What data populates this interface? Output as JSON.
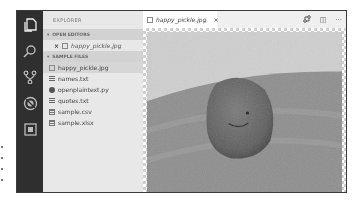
{
  "window": {
    "activity_bar": {
      "items": [
        {
          "id": "explorer",
          "icon": "files-icon"
        },
        {
          "id": "search",
          "icon": "search-icon"
        },
        {
          "id": "source-control",
          "icon": "source-control-icon"
        },
        {
          "id": "debug",
          "icon": "debug-icon"
        },
        {
          "id": "extensions",
          "icon": "extensions-icon"
        }
      ]
    },
    "sidebar": {
      "title": "EXPLORER",
      "open_editors": {
        "label": "OPEN EDITORS",
        "items": [
          {
            "name": "happy_pickle.jpg",
            "icon": "image-file-icon",
            "close_glyph": "×"
          }
        ]
      },
      "sample_files": {
        "label": "SAMPLE FILES",
        "items": [
          {
            "name": "happy_pickle.jpg",
            "icon": "image-file-icon",
            "selected": true
          },
          {
            "name": "names.txt",
            "icon": "text-file-icon"
          },
          {
            "name": "openplaintext.py",
            "icon": "python-file-icon"
          },
          {
            "name": "quotes.txt",
            "icon": "text-file-icon"
          },
          {
            "name": "sample.csv",
            "icon": "table-file-icon"
          },
          {
            "name": "sample.xlsx",
            "icon": "table-file-icon"
          }
        ]
      }
    },
    "editor": {
      "tab": {
        "label": "happy_pickle.jpg",
        "close_glyph": "×",
        "icon": "image-file-icon"
      },
      "actions": [
        {
          "id": "open-changes",
          "icon": "compare-icon"
        },
        {
          "id": "split-editor",
          "icon": "split-editor-icon",
          "glyph": "◫"
        },
        {
          "id": "more-actions",
          "icon": "ellipsis-icon",
          "glyph": "···"
        }
      ],
      "image": {
        "subject": "pickle with a smiley face on a plate"
      }
    }
  }
}
